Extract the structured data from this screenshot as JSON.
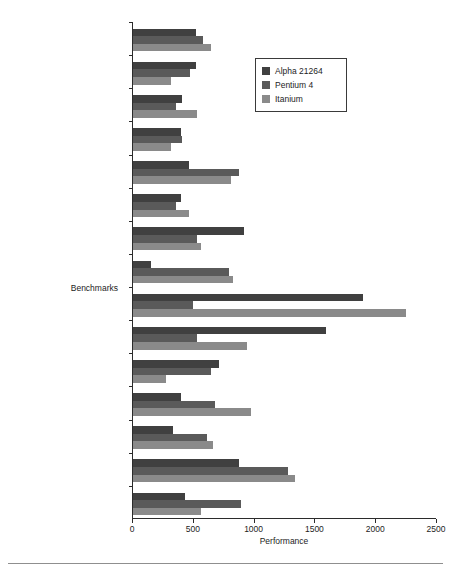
{
  "chart_data": {
    "type": "bar",
    "orientation": "horizontal",
    "title": "",
    "xlabel": "Performance",
    "ylabel": "Benchmarks",
    "xlim": [
      0,
      2500
    ],
    "xticks": [
      0,
      500,
      1000,
      1500,
      2000,
      2500
    ],
    "grid": false,
    "legend_position": "upper right",
    "categories": [
      "SPECfp_base2000",
      "apsi",
      "sixtrack",
      "fma3d",
      "lucas",
      "ammp",
      "facerec",
      "equake",
      "art",
      "galgel",
      "mesa",
      "applu",
      "mgrid",
      "swim",
      "wupwise"
    ],
    "series": [
      {
        "name": "Alpha 21264",
        "color": "#404040",
        "values": [
          515,
          515,
          400,
          395,
          460,
          395,
          915,
          150,
          1890,
          1590,
          710,
          395,
          330,
          870,
          425
        ]
      },
      {
        "name": "Pentium 4",
        "color": "#5a5a5a",
        "values": [
          575,
          470,
          355,
          400,
          870,
          355,
          530,
          790,
          490,
          530,
          640,
          675,
          610,
          1275,
          890
        ]
      },
      {
        "name": "Itanium",
        "color": "#8a8a8a",
        "values": [
          640,
          315,
          530,
          310,
          805,
          460,
          560,
          820,
          2245,
          940,
          270,
          970,
          660,
          1330,
          560
        ]
      }
    ]
  },
  "legend": {
    "entries": [
      {
        "label": "Alpha 21264",
        "color": "#404040"
      },
      {
        "label": "Pentium 4",
        "color": "#5a5a5a"
      },
      {
        "label": "Itanium",
        "color": "#8a8a8a"
      }
    ]
  }
}
